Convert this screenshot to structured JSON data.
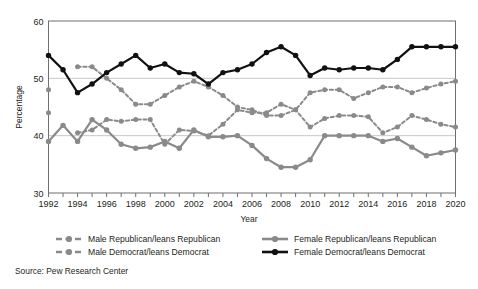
{
  "chart_data": {
    "type": "line",
    "title": "",
    "xlabel": "Year",
    "ylabel": "Percentage",
    "xlim": [
      1992,
      2020
    ],
    "ylim": [
      30,
      60
    ],
    "yticks": [
      30,
      40,
      50,
      60
    ],
    "grid": true,
    "legend_position": "bottom",
    "source": "Source: Pew Research Center",
    "x": [
      1992,
      1993,
      1994,
      1995,
      1996,
      1997,
      1998,
      1999,
      2000,
      2001,
      2002,
      2003,
      2004,
      2005,
      2006,
      2007,
      2008,
      2009,
      2010,
      2011,
      2012,
      2013,
      2014,
      2015,
      2016,
      2017,
      2018,
      2019,
      2020
    ],
    "xtick_labels": [
      "1992",
      "1994",
      "1996",
      "1998",
      "2000",
      "2002",
      "2004",
      "2006",
      "2008",
      "2010",
      "2012",
      "2014",
      "2016",
      "2018",
      "2020"
    ],
    "series": [
      {
        "name": "Male Republican/leans Republican",
        "key": "male_rep",
        "color": "#8a8a8a",
        "style": "dashed",
        "values": [
          48.0,
          null,
          52.0,
          52.0,
          50.0,
          48.0,
          45.5,
          45.5,
          47.0,
          48.5,
          49.5,
          48.5,
          47.0,
          45.0,
          44.5,
          43.5,
          43.5,
          44.5,
          47.5,
          48.0,
          48.0,
          46.5,
          47.5,
          48.5,
          48.5,
          47.5,
          48.3,
          49.0,
          49.5
        ]
      },
      {
        "name": "Male Democrat/leans Democrat",
        "key": "male_dem",
        "color": "#8a8a8a",
        "style": "dashed",
        "values": [
          44.0,
          null,
          40.5,
          41.0,
          42.8,
          42.5,
          42.8,
          42.8,
          38.5,
          41.0,
          40.8,
          40.0,
          42.0,
          44.5,
          44.0,
          44.0,
          45.5,
          44.5,
          41.5,
          43.0,
          43.5,
          43.5,
          43.3,
          40.5,
          41.5,
          43.5,
          42.8,
          42.0,
          41.5
        ]
      },
      {
        "name": "Female Republican/leans Republican",
        "key": "female_rep",
        "color": "#8a8a8a",
        "style": "solid",
        "values": [
          39.0,
          41.8,
          39.0,
          42.8,
          41.0,
          38.5,
          37.8,
          38.0,
          39.0,
          37.8,
          41.0,
          39.8,
          39.8,
          40.0,
          38.3,
          36.0,
          34.5,
          34.5,
          35.8,
          40.0,
          40.0,
          40.0,
          40.0,
          39.0,
          39.5,
          38.0,
          36.5,
          37.0,
          37.5
        ]
      },
      {
        "name": "Female Democrat/leans Democrat",
        "key": "female_dem",
        "color": "#111111",
        "style": "solid",
        "values": [
          54.0,
          51.5,
          47.5,
          49.0,
          51.0,
          52.5,
          54.0,
          51.8,
          52.5,
          51.0,
          50.8,
          49.0,
          51.0,
          51.5,
          52.5,
          54.5,
          55.5,
          54.0,
          50.5,
          51.8,
          51.5,
          51.8,
          51.8,
          51.5,
          53.3,
          55.5,
          55.5,
          55.5,
          55.5
        ]
      }
    ]
  },
  "axes": {
    "y_title": "Percentage",
    "x_title": "Year",
    "y_ticks": [
      "60",
      "50",
      "40",
      "30"
    ],
    "x_ticks": [
      "1992",
      "1994",
      "1996",
      "1998",
      "2000",
      "2002",
      "2004",
      "2006",
      "2008",
      "2010",
      "2012",
      "2014",
      "2016",
      "2018",
      "2020"
    ]
  },
  "legend": {
    "entries": [
      {
        "label": "Male Republican/leans Republican",
        "color": "#8a8a8a",
        "style": "dashed"
      },
      {
        "label": "Male Democrat/leans Democrat",
        "color": "#8a8a8a",
        "style": "dashed"
      },
      {
        "label": "Female Republican/leans Republican",
        "color": "#8a8a8a",
        "style": "solid"
      },
      {
        "label": "Female Democrat/leans Democrat",
        "color": "#111111",
        "style": "solid"
      }
    ]
  },
  "footer": {
    "source": "Source: Pew Research Center"
  },
  "colors": {
    "grey_series": "#8a8a8a",
    "black_series": "#111111",
    "axis": "#6f6f6f",
    "grid": "#b9b9b9",
    "text": "#231f20",
    "background": "#ffffff"
  }
}
